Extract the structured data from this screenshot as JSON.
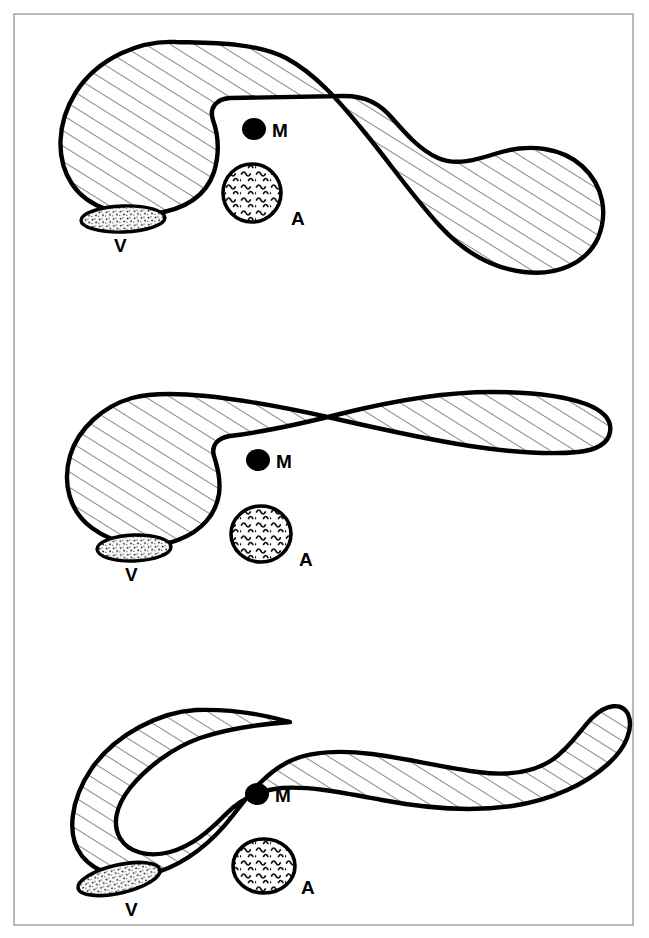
{
  "figure": {
    "width": 649,
    "height": 938,
    "background_color": "#ffffff",
    "frame": {
      "stroke_color": "#a8a8a8",
      "stroke_width": 1.6,
      "x": 14,
      "y": 14,
      "width": 619,
      "height": 911
    },
    "stroke_color": "#000000",
    "outline_width": 4.2,
    "hatch_color": "#1a1a1a",
    "hatch_width": 1.0,
    "marker_fill": "#000000"
  },
  "legend_keys": [
    {
      "key": "M",
      "name": "solid-dot-marker",
      "description": "solid black dot"
    },
    {
      "key": "A",
      "name": "wavy-filled-circle",
      "description": "circle with wavy squiggle fill"
    },
    {
      "key": "V",
      "name": "stippled-ellipse",
      "description": "ellipse with fine stipple dots"
    }
  ],
  "panels": [
    {
      "id": "panel-top",
      "index": 1,
      "name": "panel-top",
      "labels": {
        "m": "M",
        "a": "A",
        "v": "V"
      },
      "label_positions": {
        "m": {
          "x": 272,
          "y": 137
        },
        "a": {
          "x": 291,
          "y": 225
        },
        "v": {
          "x": 114,
          "y": 252
        }
      },
      "markers": {
        "m_dot": {
          "cx": 254,
          "cy": 129,
          "r": 11
        },
        "a_circle": {
          "cx": 252,
          "cy": 193,
          "rx": 30,
          "ry": 29,
          "rotate": 0
        },
        "v_ellipse": {
          "cx": 123,
          "cy": 219,
          "rx": 42,
          "ry": 13,
          "rotate": -2
        }
      },
      "body_path": "M 150 82 C 120 52 72 78 62 126 C 54 166 68 198 104 209 C 138 220 176 212 198 186 C 214 166 216 141 214 122 C 212 108 218 98 232 96 L 420 96 C 448 96 468 116 486 140 C 504 164 528 158 552 152 C 580 145 604 160 608 188 C 614 222 592 250 556 258 C 516 267 470 254 444 228 C 414 198 382 168 354 144 C 326 120 300 106 272 98 C 248 92 214 90 192 86 C 174 83 162 88 150 82 Z",
      "body_path_note": "outer silhouette: large left lobe plus sweeping right lobe with concave notch",
      "hatch_angle_deg": -58
    },
    {
      "id": "panel-middle",
      "index": 2,
      "name": "panel-middle",
      "labels": {
        "m": "M",
        "a": "A",
        "v": "V"
      },
      "label_positions": {
        "m": {
          "x": 276,
          "y": 466
        },
        "a": {
          "x": 299,
          "y": 562
        },
        "v": {
          "x": 125,
          "y": 578
        }
      },
      "markers": {
        "m_dot": {
          "cx": 258,
          "cy": 460,
          "r": 11
        },
        "a_circle": {
          "cx": 261,
          "cy": 534,
          "rx": 30,
          "ry": 28,
          "rotate": 0
        },
        "v_ellipse": {
          "cx": 134,
          "cy": 548,
          "rx": 37,
          "ry": 13,
          "rotate": -2
        }
      },
      "body_path_note": "left lobe tapering into a long slender curved tail to the right",
      "hatch_angle_deg": -58
    },
    {
      "id": "panel-bottom",
      "index": 3,
      "name": "panel-bottom",
      "labels": {
        "m": "M",
        "a": "A",
        "v": "V"
      },
      "label_positions": {
        "m": {
          "x": 275,
          "y": 800
        },
        "a": {
          "x": 299,
          "y": 887
        },
        "v": {
          "x": 125,
          "y": 912
        }
      },
      "markers": {
        "m_dot": {
          "cx": 257,
          "cy": 794,
          "r": 11
        },
        "a_circle": {
          "cx": 264,
          "cy": 866,
          "rx": 31,
          "ry": 27,
          "rotate": 0
        },
        "v_ellipse": {
          "cx": 119,
          "cy": 879,
          "rx": 42,
          "ry": 14,
          "rotate": -13
        }
      },
      "body_path_note": "continuous sigmoid band sweeping from lower-left lobe to the right",
      "hatch_angle_deg": -58
    }
  ]
}
